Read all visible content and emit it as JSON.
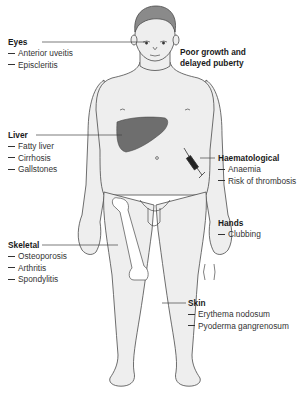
{
  "diagram": {
    "colors": {
      "body_fill": "#eeeeee",
      "outline": "#4a4a4a",
      "liver_fill": "#6e6e6e",
      "hair_fill": "#8a8a8a",
      "leader_line": "#444444"
    },
    "labels": {
      "eyes": {
        "title": "Eyes",
        "items": [
          "Anterior uveitis",
          "Episcleritis"
        ]
      },
      "growth": {
        "line1": "Poor growth and",
        "line2": "delayed puberty"
      },
      "liver": {
        "title": "Liver",
        "items": [
          "Fatty liver",
          "Cirrhosis",
          "Gallstones"
        ]
      },
      "haematological": {
        "title": "Haematological",
        "items": [
          "Anaemia",
          "Risk of thrombosis"
        ]
      },
      "hands": {
        "title": "Hands",
        "items": [
          "Clubbing"
        ]
      },
      "skeletal": {
        "title": "Skeletal",
        "items": [
          "Osteoporosis",
          "Arthritis",
          "Spondylitis"
        ]
      },
      "skin": {
        "title": "Skin",
        "items": [
          "Erythema nodosum",
          "Pyoderma gangrenosum"
        ]
      }
    }
  }
}
